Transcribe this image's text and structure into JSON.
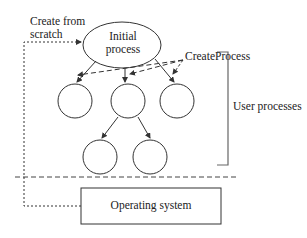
{
  "diagram": {
    "labels": {
      "create_from_scratch_line1": "Create from",
      "create_from_scratch_line2": "scratch",
      "initial_process_line1": "Initial",
      "initial_process_line2": "process",
      "create_process": "CreateProcess",
      "user_processes": "User processes",
      "operating_system": "Operating system"
    },
    "colors": {
      "stroke": "#333333",
      "bracket": "#666666"
    }
  }
}
